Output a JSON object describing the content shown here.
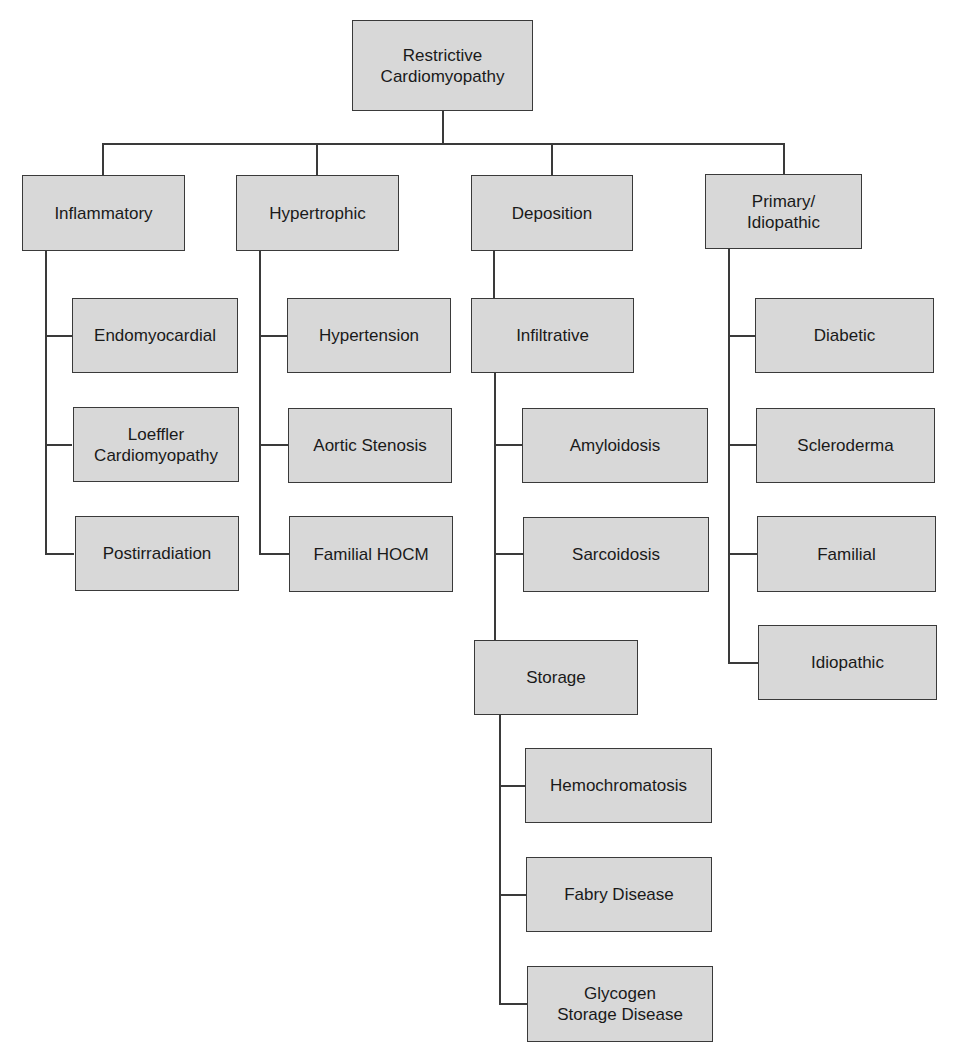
{
  "diagram": {
    "root": "Restrictive\nCardiomyopathy",
    "categories": [
      {
        "label": "Inflammatory",
        "children": [
          "Endomyocardial",
          "Loeffler\nCardiomyopathy",
          "Postirradiation"
        ]
      },
      {
        "label": "Hypertrophic",
        "children": [
          "Hypertension",
          "Aortic Stenosis",
          "Familial HOCM"
        ]
      },
      {
        "label": "Deposition",
        "subgroups": [
          {
            "label": "Infiltrative",
            "children": [
              "Amyloidosis",
              "Sarcoidosis"
            ]
          },
          {
            "label": "Storage",
            "children": [
              "Hemochromatosis",
              "Fabry Disease",
              "Glycogen\nStorage Disease"
            ]
          }
        ]
      },
      {
        "label": "Primary/\nIdiopathic",
        "children": [
          "Diabetic",
          "Scleroderma",
          "Familial",
          "Idiopathic"
        ]
      }
    ]
  },
  "colors": {
    "box_fill": "#d8d8d8",
    "line": "#3a3a3a",
    "background": "#ffffff"
  }
}
